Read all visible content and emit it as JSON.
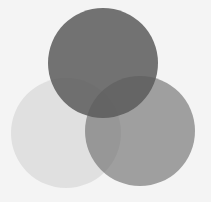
{
  "diagram": {
    "type": "venn",
    "background": "#f4f4f4",
    "circles": [
      {
        "name": "left",
        "cx": 66,
        "cy": 133,
        "r": 55,
        "fill": "#c8c8c8",
        "opacity": 0.45
      },
      {
        "name": "right",
        "cx": 140,
        "cy": 131,
        "r": 55,
        "fill": "#6a6a6a",
        "opacity": 0.62
      },
      {
        "name": "top",
        "cx": 103,
        "cy": 63,
        "r": 55,
        "fill": "#5a5a5a",
        "opacity": 0.85
      }
    ]
  }
}
